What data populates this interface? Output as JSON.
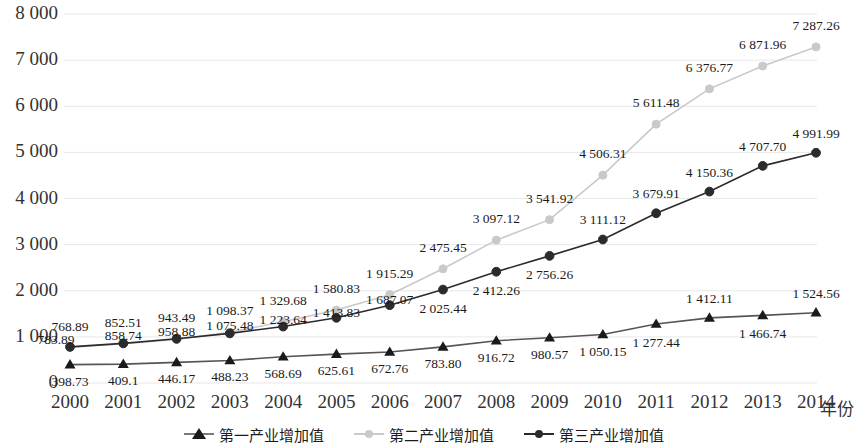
{
  "axes": {
    "x_axis_title": "年份",
    "y_ticks": [
      "8 000",
      "7 000",
      "6 000",
      "5 000",
      "4 000",
      "3 000",
      "2 000",
      "1 000",
      "0"
    ],
    "x_ticks": [
      "2000",
      "2001",
      "2002",
      "2003",
      "2004",
      "2005",
      "2006",
      "2007",
      "2008",
      "2009",
      "2010",
      "2011",
      "2012",
      "2013",
      "2014"
    ]
  },
  "legend": {
    "items": [
      {
        "label": "第一产业增加值",
        "marker": "triangle-marker",
        "color": "#7a7a7a"
      },
      {
        "label": "第二产业增加值",
        "marker": "circle-marker",
        "color": "#c9c9c9"
      },
      {
        "label": "第三产业增加值",
        "marker": "circle-marker",
        "color": "#2b2b2b"
      }
    ]
  },
  "colors": {
    "series1": "#555555",
    "series2": "#c9c9c9",
    "series3": "#2b2b2b",
    "grid": "#e8e8e8"
  },
  "chart_data": {
    "type": "line",
    "title": "",
    "xlabel": "年份",
    "ylabel": "",
    "ylim": [
      0,
      8000
    ],
    "ytick_step": 1000,
    "grid": true,
    "legend_position": "bottom",
    "categories": [
      "2000",
      "2001",
      "2002",
      "2003",
      "2004",
      "2005",
      "2006",
      "2007",
      "2008",
      "2009",
      "2010",
      "2011",
      "2012",
      "2013",
      "2014"
    ],
    "series": [
      {
        "name": "第一产业增加值",
        "marker": "triangle",
        "color": "#555555",
        "values": [
          398.73,
          409.1,
          446.17,
          488.23,
          568.69,
          625.61,
          672.76,
          783.8,
          916.72,
          980.57,
          1050.15,
          1277.44,
          1412.11,
          1466.74,
          1524.56
        ],
        "labels": [
          "398.73",
          "409.1",
          "446.17",
          "488.23",
          "568.69",
          "625.61",
          "672.76",
          "783.80",
          "916.72",
          "980.57",
          "1 050.15",
          "1 277.44",
          "1 412.11",
          "1 466.74",
          "1 524.56"
        ]
      },
      {
        "name": "第二产业增加值",
        "marker": "circle",
        "color": "#c9c9c9",
        "values": [
          768.89,
          852.51,
          943.49,
          1098.37,
          1329.68,
          1580.83,
          1915.29,
          2475.45,
          3097.12,
          3541.92,
          4506.31,
          5611.48,
          6376.77,
          6871.96,
          7287.26
        ],
        "labels": [
          "768.89",
          "852.51",
          "943.49",
          "1 098.37",
          "1 329.68",
          "1 580.83",
          "1 915.29",
          "2 475.45",
          "3 097.12",
          "3 541.92",
          "4 506.31",
          "5 611.48",
          "6 376.77",
          "6 871.96",
          "7 287.26"
        ]
      },
      {
        "name": "第三产业增加值",
        "marker": "circle",
        "color": "#2b2b2b",
        "values": [
          783.89,
          858.74,
          958.88,
          1075.48,
          1223.64,
          1413.83,
          1687.07,
          2025.44,
          2412.26,
          2756.26,
          3111.12,
          3679.91,
          4150.36,
          4707.7,
          4991.99
        ],
        "labels": [
          "783.89",
          "858.74",
          "958.88",
          "1 075.48",
          "1 223.64",
          "1 413.83",
          "1 687.07",
          "2 025.44",
          "2 412.26",
          "2 756.26",
          "3 111.12",
          "3 679.91",
          "4 150.36",
          "4 707.70",
          "4 991.99"
        ]
      }
    ]
  }
}
